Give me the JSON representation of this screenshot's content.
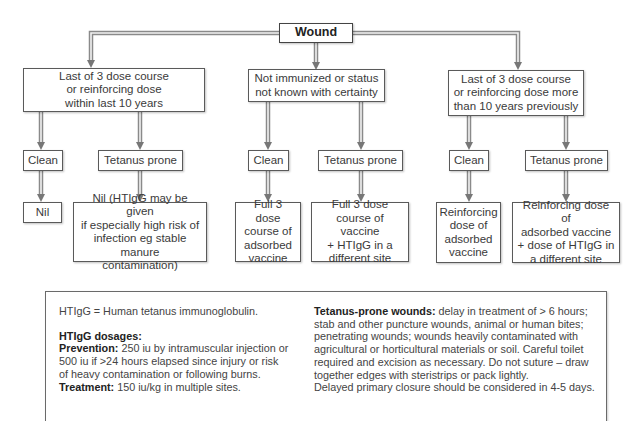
{
  "root": {
    "label": "Wound"
  },
  "branches": [
    {
      "condition": "Last of 3 dose course or reinforcing dose within last 10 years",
      "condition_lines": [
        "Last of 3 dose course",
        "or reinforcing dose",
        "within last 10 years"
      ],
      "clean": {
        "label": "Clean",
        "action_lines": [
          "Nil"
        ]
      },
      "prone": {
        "label": "Tetanus prone",
        "action_lines": [
          "Nil (HTIgG may be given",
          "if especially high risk of",
          "infection eg stable manure",
          "contamination)"
        ]
      }
    },
    {
      "condition": "Not immunized or status not known with certainty",
      "condition_lines": [
        "Not immunized or status",
        "not known with certainty"
      ],
      "clean": {
        "label": "Clean",
        "action_lines": [
          "Full 3 dose",
          "course of",
          "adsorbed",
          "vaccine"
        ]
      },
      "prone": {
        "label": "Tetanus prone",
        "action_lines": [
          "Full 3 dose",
          "course of vaccine",
          "+ HTIgG in a",
          "different site"
        ]
      }
    },
    {
      "condition": "Last of 3 dose course or reinforcing dose more than 10 years previously",
      "condition_lines": [
        "Last of 3 dose course",
        "or reinforcing dose more",
        "than 10 years previously"
      ],
      "clean": {
        "label": "Clean",
        "action_lines": [
          "Reinforcing",
          "dose of",
          "adsorbed",
          "vaccine"
        ]
      },
      "prone": {
        "label": "Tetanus prone",
        "action_lines": [
          "Reinforcing dose of",
          "adsorbed vaccine",
          "+ dose of HTIgG in",
          "a different site"
        ]
      }
    }
  ],
  "notes": {
    "definition": "HTIgG = Human tetanus immunoglobulin.",
    "dosages_heading": "HTIgG dosages:",
    "prevention_label": "Prevention:",
    "prevention_lines": [
      " 250 iu by intramuscular injection or",
      "500 iu if >24 hours elapsed since injury or risk",
      "of heavy contamination or following burns."
    ],
    "treatment_label": "Treatment:",
    "treatment_text": " 150 iu/kg in multiple sites.",
    "prone_label": "Tetanus-prone wounds:",
    "prone_lines": [
      " delay in treatment of > 6 hours;",
      "stab and other puncture wounds, animal or human bites;",
      "penetrating wounds; wounds heavily contaminated with",
      "agricultural or horticultural materials or soil. Careful toilet",
      "required and excision as necessary. Do not suture – draw",
      "together edges with steristrips or pack lightly.",
      "Delayed primary closure should be considered in 4-5 days."
    ]
  },
  "colors": {
    "connector": "#8a8a8a",
    "connector_light": "#e6e6e6",
    "border": "#5a5a5a",
    "text": "#3a3a3a"
  }
}
